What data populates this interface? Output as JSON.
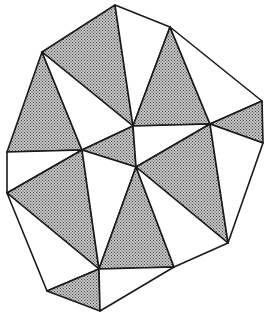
{
  "diagram": {
    "type": "triangulation",
    "shade_color": "#9a9a9a",
    "line_color": "#1a1a1a",
    "background": "#ffffff",
    "vertices": {
      "A": [
        115,
        5
      ],
      "B": [
        42,
        52
      ],
      "C": [
        7,
        152
      ],
      "D": [
        7,
        193
      ],
      "E": [
        47,
        291
      ],
      "F": [
        100,
        311
      ],
      "G": [
        174,
        267
      ],
      "H": [
        228,
        243
      ],
      "I": [
        263,
        143
      ],
      "J": [
        262,
        101
      ],
      "K": [
        170,
        27
      ],
      "L": [
        133,
        126
      ],
      "M": [
        82,
        150
      ],
      "N": [
        136,
        167
      ],
      "O": [
        99,
        269
      ],
      "P": [
        210,
        124
      ]
    },
    "triangles": [
      {
        "v": [
          "A",
          "B",
          "L"
        ],
        "shaded": true
      },
      {
        "v": [
          "A",
          "K",
          "L"
        ],
        "shaded": false
      },
      {
        "v": [
          "K",
          "L",
          "P"
        ],
        "shaded": true
      },
      {
        "v": [
          "K",
          "J",
          "P"
        ],
        "shaded": false
      },
      {
        "v": [
          "J",
          "I",
          "P"
        ],
        "shaded": true
      },
      {
        "v": [
          "B",
          "C",
          "M"
        ],
        "shaded": true
      },
      {
        "v": [
          "B",
          "M",
          "L"
        ],
        "shaded": false
      },
      {
        "v": [
          "L",
          "M",
          "N"
        ],
        "shaded": true
      },
      {
        "v": [
          "L",
          "N",
          "P"
        ],
        "shaded": false
      },
      {
        "v": [
          "C",
          "D",
          "M"
        ],
        "shaded": false
      },
      {
        "v": [
          "D",
          "M",
          "O"
        ],
        "shaded": true
      },
      {
        "v": [
          "M",
          "N",
          "O"
        ],
        "shaded": false
      },
      {
        "v": [
          "N",
          "P",
          "H"
        ],
        "shaded": true
      },
      {
        "v": [
          "P",
          "I",
          "H"
        ],
        "shaded": false
      },
      {
        "v": [
          "N",
          "O",
          "G"
        ],
        "shaded": true
      },
      {
        "v": [
          "N",
          "G",
          "H"
        ],
        "shaded": false
      },
      {
        "v": [
          "D",
          "E",
          "O"
        ],
        "shaded": false
      },
      {
        "v": [
          "E",
          "O",
          "F"
        ],
        "shaded": true
      },
      {
        "v": [
          "O",
          "F",
          "G"
        ],
        "shaded": false
      }
    ]
  }
}
